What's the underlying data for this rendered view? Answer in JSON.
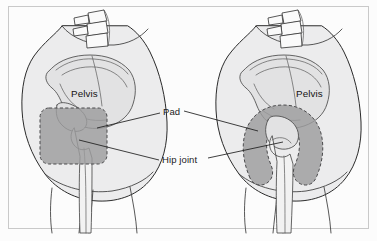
{
  "figure": {
    "type": "medical-illustration",
    "width": 377,
    "height": 241,
    "background_color": "#ffffff",
    "frame_color": "#c9c9c9",
    "body_fill_color": "#ececed",
    "bone_fill_color": "#e2e2e3",
    "pad_fill_color": "#9c9c9e",
    "pad_outline_color": "#4a4a4c",
    "label_color": "#1b1b1b",
    "leader_color": "#1d1d1d"
  },
  "labels": {
    "pelvis_left": "Pelvis",
    "pelvis_right": "Pelvis",
    "pad": "Pad",
    "hip_joint": "Hip joint"
  },
  "panels": [
    {
      "id": "left-panel",
      "position": "left",
      "pad_shape": "rounded-rectangle",
      "parts": [
        "vertebrae",
        "pelvis",
        "hip-joint",
        "femur",
        "pad"
      ]
    },
    {
      "id": "right-panel",
      "position": "right",
      "pad_shape": "horseshoe",
      "parts": [
        "vertebrae",
        "pelvis",
        "hip-joint",
        "femur",
        "pad"
      ]
    }
  ]
}
